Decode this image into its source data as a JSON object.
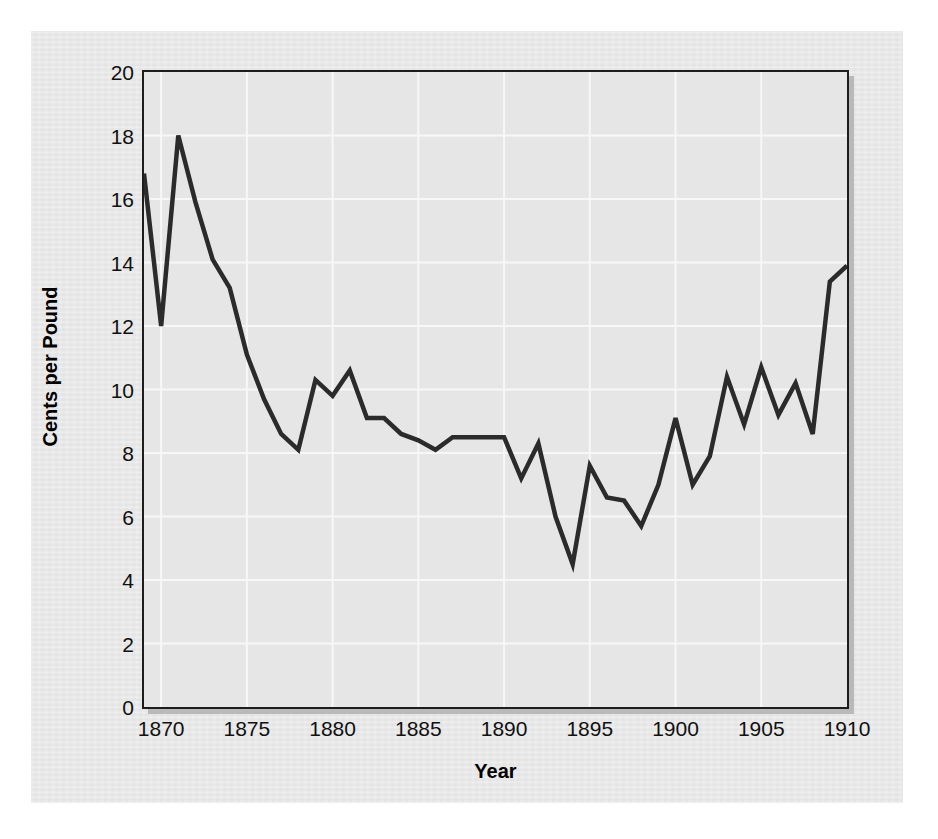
{
  "chart_data": {
    "type": "line",
    "title": "",
    "xlabel": "Year",
    "ylabel": "Cents per Pound",
    "xlim": [
      1869,
      1910
    ],
    "ylim": [
      0,
      20
    ],
    "grid": true,
    "legend": false,
    "legend_position": "none",
    "line_color": "#2b2b2b",
    "plot_background": "#e6e6e6",
    "figure_background": "#e8e8e8",
    "gridline_color": "#f7f7f7",
    "axis_color": "#1d1d1d",
    "xticks": [
      1870,
      1875,
      1880,
      1885,
      1890,
      1895,
      1900,
      1905,
      1910
    ],
    "xtick_labels": [
      "1870",
      "1875",
      "1880",
      "1885",
      "1890",
      "1895",
      "1900",
      "1905",
      "1910"
    ],
    "yticks": [
      0,
      2,
      4,
      6,
      8,
      10,
      12,
      14,
      16,
      18,
      20
    ],
    "ytick_labels": [
      "0",
      "2",
      "4",
      "6",
      "8",
      "10",
      "12",
      "14",
      "16",
      "18",
      "20"
    ],
    "x": [
      1869,
      1870,
      1871,
      1872,
      1873,
      1874,
      1875,
      1876,
      1877,
      1878,
      1879,
      1880,
      1881,
      1882,
      1883,
      1884,
      1885,
      1886,
      1887,
      1888,
      1889,
      1890,
      1891,
      1892,
      1893,
      1894,
      1895,
      1896,
      1897,
      1898,
      1899,
      1900,
      1901,
      1902,
      1903,
      1904,
      1905,
      1906,
      1907,
      1908,
      1909,
      1910
    ],
    "values": [
      16.8,
      12.0,
      18.0,
      15.9,
      14.1,
      13.2,
      11.1,
      9.7,
      8.6,
      8.1,
      10.3,
      9.8,
      10.6,
      9.1,
      9.1,
      8.6,
      8.4,
      8.1,
      8.5,
      8.5,
      8.5,
      8.5,
      7.2,
      8.3,
      6.0,
      4.5,
      7.6,
      6.6,
      6.5,
      5.7,
      7.0,
      9.1,
      7.0,
      7.9,
      10.4,
      8.9,
      10.7,
      9.2,
      10.2,
      8.6,
      13.4,
      13.9
    ],
    "series": [
      {
        "name": "Cotton price",
        "values": [
          16.8,
          12.0,
          18.0,
          15.9,
          14.1,
          13.2,
          11.1,
          9.7,
          8.6,
          8.1,
          10.3,
          9.8,
          10.6,
          9.1,
          9.1,
          8.6,
          8.4,
          8.1,
          8.5,
          8.5,
          8.5,
          8.5,
          7.2,
          8.3,
          6.0,
          4.5,
          7.6,
          6.6,
          6.5,
          5.7,
          7.0,
          9.1,
          7.0,
          7.9,
          10.4,
          8.9,
          10.7,
          9.2,
          10.2,
          8.6,
          13.4,
          13.9
        ]
      }
    ],
    "annotations": []
  }
}
